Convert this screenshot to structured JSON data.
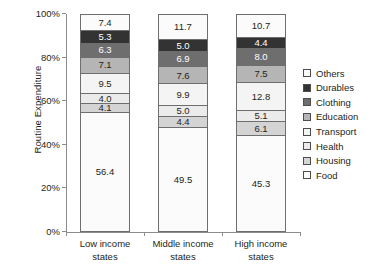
{
  "chart_data": {
    "type": "bar",
    "subtype": "stacked-100-percent",
    "title": "",
    "subtitle": "",
    "xlabel": "",
    "ylabel": "Routine Expenditure",
    "ylim": [
      0,
      100
    ],
    "ytick_labels": [
      "0%",
      "20%",
      "40%",
      "60%",
      "80%",
      "100%"
    ],
    "ytick_values": [
      0,
      20,
      40,
      60,
      80,
      100
    ],
    "grid": false,
    "legend_position": "right",
    "categories": [
      "Low income states",
      "Middle income states",
      "High income states"
    ],
    "category_lines": [
      [
        "Low income",
        "states"
      ],
      [
        "Middle income",
        "states"
      ],
      [
        "High income",
        "states"
      ]
    ],
    "series": [
      {
        "name": "Food",
        "color": "#fbfbfb",
        "values": [
          56.4,
          49.5,
          45.3
        ]
      },
      {
        "name": "Housing",
        "color": "#d4d4d4",
        "values": [
          4.1,
          4.4,
          6.1
        ]
      },
      {
        "name": "Health",
        "color": "#ebebeb",
        "values": [
          4.0,
          5.0,
          5.1
        ]
      },
      {
        "name": "Transport",
        "color": "#f4f4f4",
        "values": [
          9.5,
          9.9,
          12.8
        ]
      },
      {
        "name": "Education",
        "color": "#b5b5b5",
        "values": [
          7.1,
          7.6,
          7.5
        ]
      },
      {
        "name": "Clothing",
        "color": "#6e6e6e",
        "values": [
          6.3,
          6.9,
          8.0
        ]
      },
      {
        "name": "Durables",
        "color": "#333333",
        "values": [
          5.3,
          5.0,
          4.4
        ]
      },
      {
        "name": "Others",
        "color": "#fbfbfb",
        "values": [
          7.4,
          11.7,
          10.7
        ]
      }
    ],
    "legend_entries": [
      {
        "label": "Others",
        "color": "#fbfbfb"
      },
      {
        "label": "Durables",
        "color": "#333333"
      },
      {
        "label": "Clothing",
        "color": "#6e6e6e"
      },
      {
        "label": "Education",
        "color": "#b5b5b5"
      },
      {
        "label": "Transport",
        "color": "#f4f4f4"
      },
      {
        "label": "Health",
        "color": "#ebebeb"
      },
      {
        "label": "Housing",
        "color": "#d4d4d4"
      },
      {
        "label": "Food",
        "color": "#fbfbfb"
      }
    ],
    "bars": [
      {
        "category": "Low income states",
        "stack_top_to_bottom": [
          {
            "name": "Others",
            "value": 7.4,
            "label": "7.4",
            "color": "#fbfbfb",
            "dark": false
          },
          {
            "name": "Durables",
            "value": 5.3,
            "label": "5.3",
            "color": "#333333",
            "dark": true
          },
          {
            "name": "Clothing",
            "value": 6.3,
            "label": "6.3",
            "color": "#6e6e6e",
            "dark": true
          },
          {
            "name": "Education",
            "value": 7.1,
            "label": "7.1",
            "color": "#b5b5b5",
            "dark": false
          },
          {
            "name": "Transport",
            "value": 9.5,
            "label": "9.5",
            "color": "#f4f4f4",
            "dark": false
          },
          {
            "name": "Health",
            "value": 4.0,
            "label": "4.0",
            "color": "#ebebeb",
            "dark": false
          },
          {
            "name": "Housing",
            "value": 4.1,
            "label": "4.1",
            "color": "#d4d4d4",
            "dark": false
          },
          {
            "name": "Food",
            "value": 56.4,
            "label": "56.4",
            "color": "#fbfbfb",
            "dark": false
          }
        ]
      },
      {
        "category": "Middle income states",
        "stack_top_to_bottom": [
          {
            "name": "Others",
            "value": 11.7,
            "label": "11.7",
            "color": "#fbfbfb",
            "dark": false
          },
          {
            "name": "Durables",
            "value": 5.0,
            "label": "5.0",
            "color": "#333333",
            "dark": true
          },
          {
            "name": "Clothing",
            "value": 6.9,
            "label": "6.9",
            "color": "#6e6e6e",
            "dark": true
          },
          {
            "name": "Education",
            "value": 7.6,
            "label": "7.6",
            "color": "#b5b5b5",
            "dark": false
          },
          {
            "name": "Transport",
            "value": 9.9,
            "label": "9.9",
            "color": "#f4f4f4",
            "dark": false
          },
          {
            "name": "Health",
            "value": 5.0,
            "label": "5.0",
            "color": "#ebebeb",
            "dark": false
          },
          {
            "name": "Housing",
            "value": 4.4,
            "label": "4.4",
            "color": "#d4d4d4",
            "dark": false
          },
          {
            "name": "Food",
            "value": 49.5,
            "label": "49.5",
            "color": "#fbfbfb",
            "dark": false
          }
        ]
      },
      {
        "category": "High income states",
        "stack_top_to_bottom": [
          {
            "name": "Others",
            "value": 10.7,
            "label": "10.7",
            "color": "#fbfbfb",
            "dark": false
          },
          {
            "name": "Durables",
            "value": 4.4,
            "label": "4.4",
            "color": "#333333",
            "dark": true
          },
          {
            "name": "Clothing",
            "value": 8.0,
            "label": "8.0",
            "color": "#6e6e6e",
            "dark": true
          },
          {
            "name": "Education",
            "value": 7.5,
            "label": "7.5",
            "color": "#b5b5b5",
            "dark": false
          },
          {
            "name": "Transport",
            "value": 12.8,
            "label": "12.8",
            "color": "#f4f4f4",
            "dark": false
          },
          {
            "name": "Health",
            "value": 5.1,
            "label": "5.1",
            "color": "#ebebeb",
            "dark": false
          },
          {
            "name": "Housing",
            "value": 6.1,
            "label": "6.1",
            "color": "#d4d4d4",
            "dark": false
          },
          {
            "name": "Food",
            "value": 45.3,
            "label": "45.3",
            "color": "#fbfbfb",
            "dark": false
          }
        ]
      }
    ]
  }
}
